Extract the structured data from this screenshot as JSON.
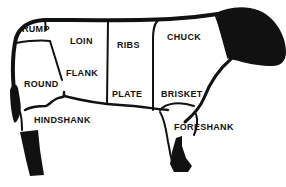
{
  "colors": {
    "ink": "#111111",
    "background": "#ffffff"
  },
  "cuts": [
    {
      "id": "rump",
      "label": "RUMP",
      "x": 22,
      "y": 28
    },
    {
      "id": "loin",
      "label": "LOIN",
      "x": 70,
      "y": 37
    },
    {
      "id": "ribs",
      "label": "RIBS",
      "x": 117,
      "y": 41
    },
    {
      "id": "chuck",
      "label": "CHUCK",
      "x": 167,
      "y": 32
    },
    {
      "id": "flank",
      "label": "FLANK",
      "x": 66,
      "y": 71
    },
    {
      "id": "round",
      "label": "ROUND",
      "x": 24,
      "y": 82
    },
    {
      "id": "plate",
      "label": "PLATE",
      "x": 112,
      "y": 90
    },
    {
      "id": "brisket",
      "label": "BRISKET",
      "x": 161,
      "y": 90
    },
    {
      "id": "hindshank",
      "label": "HINDSHANK",
      "x": 34,
      "y": 118
    },
    {
      "id": "foreshank",
      "label": "FORESHANK",
      "x": 174,
      "y": 124
    }
  ]
}
